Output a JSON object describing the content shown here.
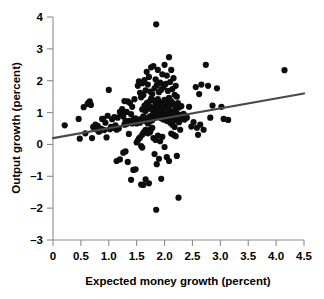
{
  "chart_data": {
    "type": "scatter",
    "title": "",
    "subtitle": "",
    "xlabel": "Expected money growth (percent)",
    "ylabel": "Output growth (percent)",
    "xlim": [
      0,
      4.5
    ],
    "ylim": [
      -3,
      4
    ],
    "xticks": [
      0,
      0.5,
      1.0,
      1.5,
      2.0,
      2.5,
      3.0,
      3.5,
      4.0,
      4.5
    ],
    "xtick_labels": [
      "0",
      "0.5",
      "1.0",
      "1.5",
      "2.0",
      "2.5",
      "3.0",
      "3.5",
      "4.0",
      "4.5"
    ],
    "yticks": [
      -3,
      -2,
      -1,
      0,
      1,
      2,
      3,
      4
    ],
    "ytick_labels": [
      "-3",
      "-2",
      "-1",
      "0",
      "1",
      "2",
      "3",
      "4"
    ],
    "grid": false,
    "legend": false,
    "legend_position": "none",
    "marker": "filled-circle",
    "marker_color": "#0d0d0d",
    "marker_size_px": 4.0,
    "axis_color": "#8d8d8d",
    "text_color": "#000000",
    "background_color": "#ffffff",
    "annotations": [],
    "trendline": {
      "type": "line",
      "name": "regression fit",
      "color": "#4a4a4a",
      "width_px": 2.2,
      "x": [
        0.0,
        4.5
      ],
      "y": [
        0.2,
        1.6
      ],
      "slope": 0.311,
      "intercept": 0.2
    },
    "series": [
      {
        "name": "observations",
        "points": [
          [
            0.21,
            0.6
          ],
          [
            0.46,
            0.8
          ],
          [
            0.48,
            0.18
          ],
          [
            0.55,
            1.17
          ],
          [
            0.58,
            0.35
          ],
          [
            0.62,
            1.27
          ],
          [
            0.64,
            1.31
          ],
          [
            0.66,
            1.35
          ],
          [
            0.68,
            1.24
          ],
          [
            0.7,
            0.2
          ],
          [
            0.72,
            0.55
          ],
          [
            0.74,
            0.52
          ],
          [
            0.76,
            0.62
          ],
          [
            0.78,
            0.47
          ],
          [
            0.8,
            0.58
          ],
          [
            0.82,
            0.4
          ],
          [
            0.84,
            0.42
          ],
          [
            0.86,
            0.5
          ],
          [
            0.88,
            0.8
          ],
          [
            0.9,
            0.8
          ],
          [
            0.92,
            0.45
          ],
          [
            0.94,
            0.68
          ],
          [
            0.96,
            0.22
          ],
          [
            0.98,
            0.9
          ],
          [
            1.0,
            1.71
          ],
          [
            1.02,
            0.48
          ],
          [
            1.04,
            0.55
          ],
          [
            1.06,
            0.79
          ],
          [
            1.08,
            0.52
          ],
          [
            1.1,
            0.86
          ],
          [
            1.12,
            0.6
          ],
          [
            1.14,
            0.46
          ],
          [
            1.14,
            -0.52
          ],
          [
            1.16,
            0.84
          ],
          [
            1.18,
            0.5
          ],
          [
            1.2,
            1.02
          ],
          [
            1.2,
            -0.47
          ],
          [
            1.22,
            0.98
          ],
          [
            1.24,
            1.11
          ],
          [
            1.26,
            0.88
          ],
          [
            1.26,
            -0.26
          ],
          [
            1.28,
            1.36
          ],
          [
            1.28,
            0.62
          ],
          [
            1.3,
            0.73
          ],
          [
            1.3,
            -0.22
          ],
          [
            1.32,
            1.02
          ],
          [
            1.32,
            0.64
          ],
          [
            1.34,
            1.35
          ],
          [
            1.34,
            -0.55
          ],
          [
            1.36,
            0.74
          ],
          [
            1.36,
            0.33
          ],
          [
            1.38,
            1.3
          ],
          [
            1.38,
            0.7
          ],
          [
            1.4,
            0.95
          ],
          [
            1.4,
            -1.11
          ],
          [
            1.42,
            1.18
          ],
          [
            1.42,
            0.66
          ],
          [
            1.44,
            0.78
          ],
          [
            1.44,
            -0.8
          ],
          [
            1.46,
            1.42
          ],
          [
            1.46,
            0.7
          ],
          [
            1.48,
            0.82
          ],
          [
            1.48,
            -0.78
          ],
          [
            1.5,
            0.66
          ],
          [
            1.5,
            0.06
          ],
          [
            1.52,
            1.84
          ],
          [
            1.52,
            0.73
          ],
          [
            1.52,
            0.12
          ],
          [
            1.54,
            1.98
          ],
          [
            1.54,
            0.76
          ],
          [
            1.54,
            0.18
          ],
          [
            1.56,
            1.62
          ],
          [
            1.56,
            0.68
          ],
          [
            1.56,
            0.22
          ],
          [
            1.58,
            1.48
          ],
          [
            1.58,
            0.8
          ],
          [
            1.58,
            -0.05
          ],
          [
            1.58,
            -1.26
          ],
          [
            1.6,
            1.92
          ],
          [
            1.6,
            1.1
          ],
          [
            1.6,
            0.3
          ],
          [
            1.6,
            -0.1
          ],
          [
            1.62,
            1.55
          ],
          [
            1.62,
            0.88
          ],
          [
            1.62,
            0.36
          ],
          [
            1.62,
            -1.27
          ],
          [
            1.64,
            2.02
          ],
          [
            1.64,
            1.22
          ],
          [
            1.64,
            0.74
          ],
          [
            1.64,
            0.4
          ],
          [
            1.66,
            1.7
          ],
          [
            1.66,
            1.05
          ],
          [
            1.66,
            0.46
          ],
          [
            1.66,
            -1.1
          ],
          [
            1.68,
            2.28
          ],
          [
            1.68,
            1.3
          ],
          [
            1.68,
            0.8
          ],
          [
            1.68,
            0.42
          ],
          [
            1.7,
            1.88
          ],
          [
            1.7,
            1.12
          ],
          [
            1.7,
            0.66
          ],
          [
            1.7,
            0.35
          ],
          [
            1.72,
            2.12
          ],
          [
            1.72,
            1.34
          ],
          [
            1.72,
            0.86
          ],
          [
            1.72,
            0.44
          ],
          [
            1.72,
            -1.22
          ],
          [
            1.74,
            1.66
          ],
          [
            1.74,
            1.18
          ],
          [
            1.74,
            0.72
          ],
          [
            1.74,
            0.38
          ],
          [
            1.76,
            2.42
          ],
          [
            1.76,
            1.44
          ],
          [
            1.76,
            0.9
          ],
          [
            1.76,
            0.48
          ],
          [
            1.78,
            1.58
          ],
          [
            1.78,
            1.08
          ],
          [
            1.78,
            0.76
          ],
          [
            1.78,
            0.52
          ],
          [
            1.8,
            2.46
          ],
          [
            1.8,
            1.38
          ],
          [
            1.8,
            0.94
          ],
          [
            1.8,
            0.2
          ],
          [
            1.82,
            1.76
          ],
          [
            1.82,
            1.16
          ],
          [
            1.82,
            0.84
          ],
          [
            1.82,
            -0.3
          ],
          [
            1.84,
            2.04
          ],
          [
            1.84,
            1.26
          ],
          [
            1.84,
            0.98
          ],
          [
            1.84,
            0.14
          ],
          [
            1.85,
            3.77
          ],
          [
            1.85,
            -2.05
          ],
          [
            1.86,
            1.86
          ],
          [
            1.86,
            1.2
          ],
          [
            1.86,
            0.88
          ],
          [
            1.86,
            -0.62
          ],
          [
            1.88,
            2.34
          ],
          [
            1.88,
            1.42
          ],
          [
            1.88,
            1.0
          ],
          [
            1.88,
            0.28
          ],
          [
            1.9,
            1.64
          ],
          [
            1.9,
            1.06
          ],
          [
            1.9,
            0.92
          ],
          [
            1.9,
            -0.45
          ],
          [
            1.92,
            1.94
          ],
          [
            1.92,
            1.28
          ],
          [
            1.92,
            0.96
          ],
          [
            1.92,
            0.1
          ],
          [
            1.94,
            1.72
          ],
          [
            1.94,
            1.14
          ],
          [
            1.94,
            0.82
          ],
          [
            1.94,
            -1.08
          ],
          [
            1.96,
            2.2
          ],
          [
            1.96,
            1.32
          ],
          [
            1.96,
            1.04
          ],
          [
            1.96,
            0.24
          ],
          [
            1.98,
            1.8
          ],
          [
            1.98,
            1.24
          ],
          [
            1.98,
            0.78
          ],
          [
            2.0,
            2.5
          ],
          [
            2.0,
            1.4
          ],
          [
            2.0,
            0.92
          ],
          [
            2.0,
            -0.08
          ],
          [
            2.02,
            1.9
          ],
          [
            2.02,
            1.18
          ],
          [
            2.02,
            0.86
          ],
          [
            2.04,
            2.16
          ],
          [
            2.04,
            1.34
          ],
          [
            2.04,
            0.74
          ],
          [
            2.04,
            -0.4
          ],
          [
            2.06,
            1.68
          ],
          [
            2.06,
            1.1
          ],
          [
            2.06,
            0.96
          ],
          [
            2.08,
            2.74
          ],
          [
            2.08,
            1.46
          ],
          [
            2.08,
            0.8
          ],
          [
            2.08,
            -0.52
          ],
          [
            2.1,
            1.96
          ],
          [
            2.1,
            1.22
          ],
          [
            2.1,
            0.68
          ],
          [
            2.12,
            2.34
          ],
          [
            2.12,
            1.36
          ],
          [
            2.12,
            0.9
          ],
          [
            2.12,
            0.34
          ],
          [
            2.14,
            1.74
          ],
          [
            2.14,
            1.04
          ],
          [
            2.14,
            0.62
          ],
          [
            2.16,
            2.08
          ],
          [
            2.16,
            1.28
          ],
          [
            2.16,
            0.84
          ],
          [
            2.16,
            0.3
          ],
          [
            2.18,
            1.56
          ],
          [
            2.18,
            0.94
          ],
          [
            2.18,
            0.55
          ],
          [
            2.2,
            1.84
          ],
          [
            2.2,
            1.12
          ],
          [
            2.2,
            0.76
          ],
          [
            2.2,
            0.26
          ],
          [
            2.22,
            1.5
          ],
          [
            2.22,
            0.98
          ],
          [
            2.22,
            -0.36
          ],
          [
            2.24,
            1.3
          ],
          [
            2.24,
            0.88
          ],
          [
            2.25,
            -1.67
          ],
          [
            2.26,
            1.16
          ],
          [
            2.26,
            0.7
          ],
          [
            2.28,
            0.92
          ],
          [
            2.28,
            0.46
          ],
          [
            2.3,
            1.2
          ],
          [
            2.3,
            0.8
          ],
          [
            2.32,
            0.86
          ],
          [
            2.34,
            0.96
          ],
          [
            2.36,
            0.78
          ],
          [
            2.38,
            0.9
          ],
          [
            2.4,
            0.84
          ],
          [
            2.44,
            1.18
          ],
          [
            2.48,
            0.56
          ],
          [
            2.52,
            0.7
          ],
          [
            2.56,
            1.8
          ],
          [
            2.58,
            0.52
          ],
          [
            2.6,
            0.3
          ],
          [
            2.62,
            1.58
          ],
          [
            2.64,
            0.62
          ],
          [
            2.66,
            1.88
          ],
          [
            2.7,
            0.46
          ],
          [
            2.74,
            2.5
          ],
          [
            2.78,
            1.84
          ],
          [
            2.82,
            0.84
          ],
          [
            2.86,
            1.22
          ],
          [
            2.94,
            1.76
          ],
          [
            3.02,
            1.18
          ],
          [
            3.06,
            0.8
          ],
          [
            3.14,
            0.77
          ],
          [
            4.15,
            2.33
          ]
        ]
      }
    ]
  },
  "axes": {
    "x_title": "Expected money growth (percent)",
    "y_title": "Output growth (percent)"
  }
}
